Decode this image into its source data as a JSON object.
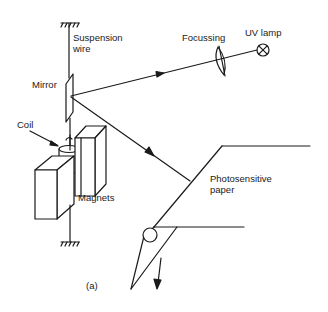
{
  "diagram": {
    "caption": "(a)",
    "labels": {
      "suspension_wire": "Suspension\nwire",
      "focussing": "Focussing",
      "uv_lamp": "UV lamp",
      "mirror": "Mirror",
      "coil": "Coil",
      "magnets": "Magnets",
      "photosensitive_paper": "Photosensitive\npaper"
    },
    "colors": {
      "line": "#1a1a1a",
      "background": "#ffffff"
    }
  }
}
